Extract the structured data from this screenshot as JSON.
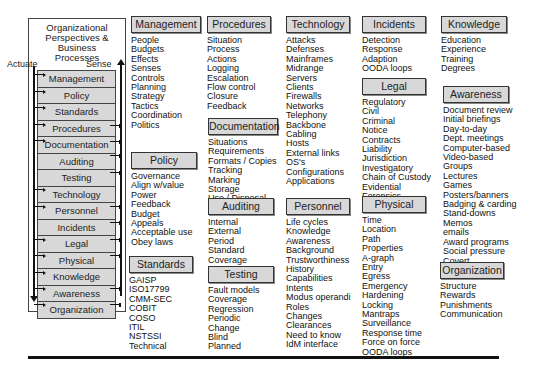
{
  "left_panel": {
    "title": "Organizational\nPerspectives &\nBusiness\nProcesses",
    "actuate_label": "Actuate",
    "sense_label": "Sense",
    "layers": [
      "Management",
      "Policy",
      "Standards",
      "Procedures",
      "Documentation",
      "Auditing",
      "Testing",
      "Technology",
      "Personnel",
      "Incidents",
      "Legal",
      "Physical",
      "Knowledge",
      "Awareness",
      "Organization"
    ]
  },
  "sections": {
    "management": {
      "title": "Management",
      "items": [
        "People",
        "Budgets",
        "Effects",
        "Senses",
        "Controls",
        "Planning",
        "Strategy",
        "Tactics",
        "Coordination",
        "Politics"
      ]
    },
    "policy": {
      "title": "Policy",
      "items": [
        "Governance",
        "Align w/value",
        "Power",
        "Feedback",
        "Budget",
        "Appeals",
        "Acceptable use",
        "Obey laws"
      ]
    },
    "standards": {
      "title": "Standards",
      "items": [
        "GAISP",
        "ISO17799",
        "CMM-SEC",
        "COBIT",
        "COSO",
        "ITIL",
        "NSTSSI",
        "Technical"
      ]
    },
    "procedures": {
      "title": "Procedures",
      "items": [
        "Situation",
        "Process",
        "Actions",
        "Logging",
        "Escalation",
        "Flow control",
        "Closure",
        "Feedback"
      ]
    },
    "documentation": {
      "title": "Documentation",
      "items": [
        "Situations",
        "Requirements",
        "Formats / Copies",
        "Tracking",
        "Marking",
        "Storage",
        "Use / Disposal"
      ]
    },
    "auditing": {
      "title": "Auditing",
      "items": [
        "Internal",
        "External",
        "Period",
        "Standard",
        "Coverage"
      ]
    },
    "testing": {
      "title": "Testing",
      "items": [
        "Fault models",
        "Coverage",
        "Regression",
        "Periodic",
        "Change",
        "Blind",
        "Planned"
      ]
    },
    "technology": {
      "title": "Technology",
      "items": [
        "Attacks",
        "Defenses",
        "Mainframes",
        "Midrange",
        "Servers",
        "Clients",
        "Firewalls",
        "Networks",
        "Telephony",
        "Backbone",
        "Cabling",
        "Hosts",
        "External links",
        "OS's",
        "Configurations",
        "Applications"
      ]
    },
    "personnel": {
      "title": "Personnel",
      "items": [
        "Life cycles",
        "Knowledge",
        "Awareness",
        "Background",
        "Trustworthiness",
        "History",
        "Capabilities",
        "Intents",
        "Modus operandi",
        "Roles",
        "Changes",
        "Clearances",
        "Need to know",
        "IdM interface"
      ]
    },
    "incidents": {
      "title": "Incidents",
      "items": [
        "Detection",
        "Response",
        "Adaption",
        "OODA loops"
      ]
    },
    "legal": {
      "title": "Legal",
      "items": [
        "Regulatory",
        "Civil",
        "Criminal",
        "Notice",
        "Contracts",
        "Liability",
        "Jurisdiction",
        "Investigatory",
        "Chain of Custody",
        "Evidential",
        "Forensics"
      ]
    },
    "physical": {
      "title": "Physical",
      "items": [
        "Time",
        "Location",
        "Path",
        "Properties",
        "A-graph",
        "Entry",
        "Egress",
        "Emergency",
        "Hardening",
        "Locking",
        "Mantraps",
        "Surveillance",
        "Response time",
        "Force on force",
        "OODA loops"
      ]
    },
    "knowledge": {
      "title": "Knowledge",
      "items": [
        "Education",
        "Experience",
        "Training",
        "Degrees"
      ]
    },
    "awareness": {
      "title": "Awareness",
      "items": [
        "Document review",
        "Initial briefings",
        "Day-to-day",
        "Dept. meetings",
        "Computer-based",
        "Video-based",
        "Groups",
        "Lectures",
        "Games",
        "Posters/banners",
        "Badging & carding",
        "Stand-downs",
        "Memos",
        "emails",
        "Award programs",
        "Social pressure",
        "Covert"
      ]
    },
    "organization": {
      "title": "Organization",
      "items": [
        "Structure",
        "Rewards",
        "Punishments",
        "Communication"
      ]
    }
  }
}
